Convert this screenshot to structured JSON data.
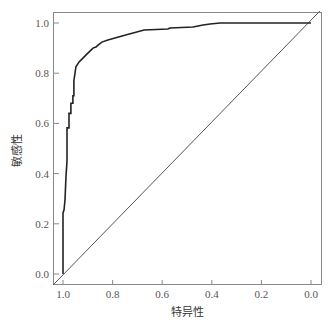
{
  "chart_data": {
    "type": "line",
    "title": "",
    "xlabel": "特异性",
    "ylabel": "敏感性",
    "x_reversed": true,
    "xlim": [
      1.0,
      0.0
    ],
    "ylim": [
      0.0,
      1.0
    ],
    "x_ticks": [
      "1.0",
      "0.8",
      "0.6",
      "0.4",
      "0.2",
      "0.0"
    ],
    "y_ticks": [
      "0.0",
      "0.2",
      "0.4",
      "0.6",
      "0.8",
      "1.0"
    ],
    "grid": false,
    "legend": null,
    "series": [
      {
        "name": "ROC curve",
        "color": "#222222",
        "x_specificity": [
          1.0,
          1.0,
          0.996,
          0.992,
          0.988,
          0.984,
          0.984,
          0.976,
          0.976,
          0.968,
          0.968,
          0.96,
          0.96,
          0.956,
          0.956,
          0.948,
          0.935,
          0.907,
          0.879,
          0.867,
          0.859,
          0.843,
          0.819,
          0.762,
          0.673,
          0.577,
          0.569,
          0.476,
          0.435,
          0.407,
          0.367,
          0.032,
          0.0
        ],
        "y_sensitivity": [
          0.0,
          0.243,
          0.255,
          0.295,
          0.39,
          0.45,
          0.582,
          0.582,
          0.64,
          0.64,
          0.68,
          0.68,
          0.71,
          0.71,
          0.77,
          0.825,
          0.845,
          0.873,
          0.9,
          0.904,
          0.912,
          0.924,
          0.932,
          0.948,
          0.972,
          0.976,
          0.98,
          0.984,
          0.992,
          0.996,
          1.0,
          1.0,
          1.0
        ]
      },
      {
        "name": "Reference line",
        "color": "#555555",
        "x_specificity": [
          1.04,
          -0.036
        ],
        "y_sensitivity": [
          -0.044,
          1.048
        ]
      }
    ]
  },
  "axes": {
    "x_title": "特异性",
    "y_title": "敏感性"
  }
}
